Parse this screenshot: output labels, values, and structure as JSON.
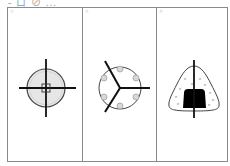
{
  "header": {
    "text": "- ロ ⊘ ..."
  },
  "panels": [
    {
      "label": "①",
      "figure": "circle-with-crosshair"
    },
    {
      "label": "②",
      "figure": "circle-with-six-dots-and-three-spokes"
    },
    {
      "label": "③",
      "figure": "rounded-triangle-with-black-block-and-vertical-line"
    }
  ],
  "colors": {
    "stroke": "#111111",
    "fill_light": "#e6e6e6",
    "frame": "#8a8a8a",
    "dots": "#9a9a9a"
  }
}
